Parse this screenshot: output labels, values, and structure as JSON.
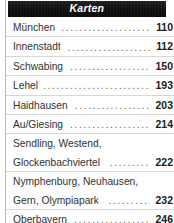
{
  "panel": {
    "name": "Karten",
    "colors": {
      "header_background": "#120f10",
      "header_text": "#ffffff",
      "entry_text": "#30302f",
      "page_number_text": "#1a1a1a",
      "separator": "#d7d7d7",
      "left_rule": "#b9b9b9",
      "page_background": "#ffffff"
    }
  },
  "header": {
    "title": "Karten"
  },
  "entries": [
    {
      "lines": [
        "München"
      ],
      "page": "110",
      "leader": "...................................."
    },
    {
      "lines": [
        "Innenstadt"
      ],
      "page": "112",
      "leader": "........................................"
    },
    {
      "lines": [
        "Schwabing"
      ],
      "page": "150",
      "leader": "......................................"
    },
    {
      "lines": [
        "Lehel"
      ],
      "page": "193",
      "leader": "..........................................."
    },
    {
      "lines": [
        "Haidhausen"
      ],
      "page": "203",
      "leader": "...................................."
    },
    {
      "lines": [
        "Au/Giesing"
      ],
      "page": "214",
      "leader": "....................................."
    },
    {
      "lines": [
        "Sendling, Westend,",
        "Glockenbachviertel"
      ],
      "page": "222",
      "leader": "........................"
    },
    {
      "lines": [
        "Nymphenburg, Neuhausen,",
        "Gern, Olympiapark"
      ],
      "page": "232",
      "leader": "........................."
    },
    {
      "lines": [
        "Oberbayern"
      ],
      "page": "246",
      "leader": "....................................."
    }
  ]
}
